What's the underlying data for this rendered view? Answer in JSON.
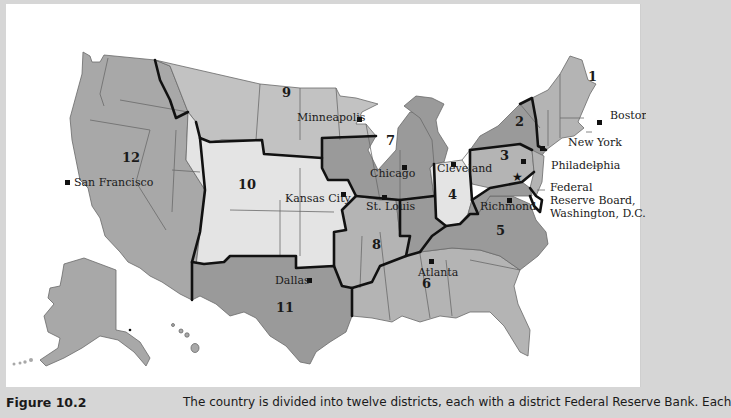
{
  "figure": {
    "label": "Figure 10.2",
    "caption": "The country is divided into twelve districts, each with a district Federal Reserve Bank. Each"
  },
  "map": {
    "title": "Federal Reserve Districts",
    "colors": {
      "background": "#ffffff",
      "page": "#d6d6d6",
      "dark_region": "#9a9a9a",
      "mid_region": "#b4b4b4",
      "light_region": "#e4e4e4",
      "district_border": "#111111",
      "state_border": "#6a6a6a"
    },
    "districts": [
      {
        "number": "1",
        "city": "Boston"
      },
      {
        "number": "2",
        "city": "New York"
      },
      {
        "number": "3",
        "city": "Philadelphia"
      },
      {
        "number": "4",
        "city": "Cleveland"
      },
      {
        "number": "5",
        "city": "Richmond"
      },
      {
        "number": "6",
        "city": "Atlanta"
      },
      {
        "number": "7",
        "city": "Chicago"
      },
      {
        "number": "8",
        "city": "St. Louis"
      },
      {
        "number": "9",
        "city": "Minneapolis"
      },
      {
        "number": "10",
        "city": "Kansas City"
      },
      {
        "number": "11",
        "city": "Dallas"
      },
      {
        "number": "12",
        "city": "San Francisco"
      }
    ],
    "board": {
      "line1": "Federal",
      "line2": "Reserve Board,",
      "line3": "Washington, D.C.",
      "icon": "star-icon"
    },
    "bank_icon": "square-marker-icon"
  }
}
